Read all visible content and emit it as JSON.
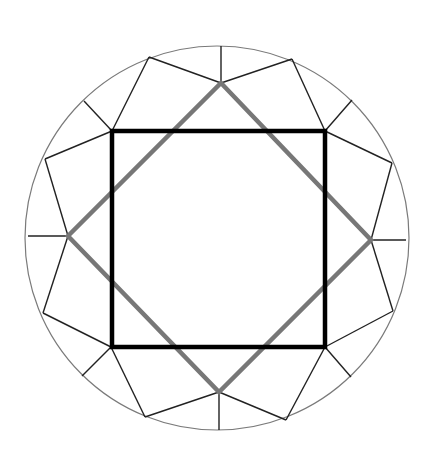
{
  "diagram": {
    "colors": {
      "background": "#ffffff",
      "circle": "#7a7a7a",
      "facet": "#222222",
      "square": "#000000",
      "diamond": "#777777"
    },
    "circle": {
      "cx": 217,
      "cy": 238,
      "r": 192
    },
    "square": {
      "x1": 112,
      "y1": 131,
      "x2": 325,
      "y2": 347
    },
    "diamond": {
      "top": [
        221,
        83
      ],
      "right": [
        371,
        240
      ],
      "bottom": [
        219,
        392
      ],
      "left": [
        68,
        236
      ]
    },
    "facet_lines": [
      [
        221,
        46,
        221,
        83
      ],
      [
        28,
        236,
        68,
        236
      ],
      [
        406,
        240,
        371,
        240
      ],
      [
        219,
        430,
        219,
        392
      ],
      [
        149,
        57,
        221,
        83
      ],
      [
        149,
        57,
        112,
        131
      ],
      [
        84,
        101,
        112,
        131
      ],
      [
        45,
        159,
        112,
        131
      ],
      [
        45,
        159,
        68,
        236
      ],
      [
        292,
        59,
        221,
        83
      ],
      [
        292,
        59,
        325,
        131
      ],
      [
        352,
        100,
        325,
        131
      ],
      [
        392,
        163,
        325,
        131
      ],
      [
        392,
        163,
        371,
        240
      ],
      [
        43,
        313,
        68,
        236
      ],
      [
        43,
        313,
        111,
        347
      ],
      [
        82,
        376,
        111,
        347
      ],
      [
        145,
        417,
        111,
        347
      ],
      [
        145,
        417,
        219,
        392
      ],
      [
        393,
        311,
        371,
        240
      ],
      [
        393,
        311,
        325,
        347
      ],
      [
        351,
        377,
        325,
        347
      ],
      [
        286,
        420,
        325,
        347
      ],
      [
        286,
        420,
        219,
        392
      ]
    ]
  }
}
